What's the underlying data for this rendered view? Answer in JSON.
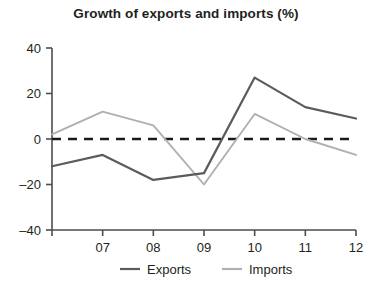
{
  "chart_data": {
    "type": "line",
    "title": "Growth of exports and imports (%)",
    "xlabel": "",
    "ylabel": "",
    "x": [
      "06",
      "07",
      "08",
      "09",
      "10",
      "11",
      "12"
    ],
    "xtick_labels": [
      "",
      "07",
      "08",
      "09",
      "10",
      "11",
      "12"
    ],
    "ytick_labels": [
      "40",
      "20",
      "0",
      "-20",
      "-40"
    ],
    "ytick_values": [
      40,
      20,
      0,
      -20,
      -40
    ],
    "ylim": [
      -40,
      40
    ],
    "grid": false,
    "legend_position": "bottom",
    "zero_reference_line": {
      "value": 0,
      "style": "dashed",
      "color": "#1a1a1a"
    },
    "series": [
      {
        "name": "Exports",
        "color": "#5b5b5b",
        "values": [
          -12,
          -7,
          -18,
          -15,
          27,
          14,
          9
        ]
      },
      {
        "name": "Imports",
        "color": "#b0b0b0",
        "values": [
          2,
          12,
          6,
          -20,
          11,
          0,
          -7
        ]
      }
    ]
  },
  "legend": {
    "items": [
      {
        "label": "Exports",
        "color": "#5b5b5b"
      },
      {
        "label": "Imports",
        "color": "#b0b0b0"
      }
    ]
  },
  "axis": {
    "color": "#4d4d4d"
  }
}
